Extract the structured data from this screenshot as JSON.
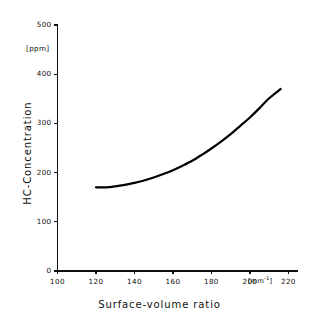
{
  "figure": {
    "background_color": "#ffffff",
    "ink_color": "#101010",
    "curve_color": "#000000"
  },
  "axes": {
    "y": {
      "title": "HC-Concentration",
      "unit_label": "[ppm]",
      "ticks": [
        "0",
        "100",
        "200",
        "300",
        "400",
        "500"
      ],
      "range": [
        0,
        500
      ]
    },
    "x": {
      "title": "Surface-volume ratio",
      "unit_prefix": "[mm",
      "unit_exponent": "-1",
      "unit_suffix": "]",
      "ticks": [
        "100",
        "120",
        "140",
        "160",
        "180",
        "200",
        "220"
      ],
      "range": [
        100,
        220
      ]
    }
  },
  "chart_data": {
    "type": "line",
    "title": "",
    "subtitle": "",
    "xlabel": "Surface-volume ratio",
    "ylabel": "HC-Concentration",
    "x_unit": "[mm^-1]",
    "y_unit": "[ppm]",
    "xlim": [
      100,
      220
    ],
    "ylim": [
      0,
      500
    ],
    "xticks": [
      100,
      120,
      140,
      160,
      180,
      200,
      220
    ],
    "yticks": [
      0,
      100,
      200,
      300,
      400,
      500
    ],
    "grid": false,
    "legend": false,
    "legend_position": "none",
    "series": [
      {
        "name": "HC-Concentration",
        "color": "#000000",
        "line_width": 2.2,
        "x": [
          120,
          125,
          130,
          135,
          140,
          145,
          150,
          155,
          160,
          165,
          170,
          175,
          180,
          185,
          190,
          195,
          200,
          205,
          210,
          216
        ],
        "y": [
          170,
          170,
          172,
          175,
          179,
          184,
          190,
          197,
          205,
          214,
          224,
          236,
          249,
          263,
          278,
          295,
          312,
          331,
          351,
          370
        ]
      }
    ],
    "annotations": []
  }
}
